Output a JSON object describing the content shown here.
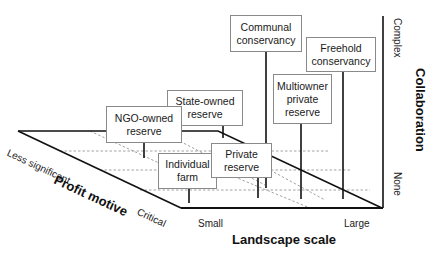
{
  "diagram": {
    "type": "3d-axis-diagram",
    "axes": {
      "x": {
        "title": "Landscape scale",
        "low": "Small",
        "high": "Large"
      },
      "y": {
        "title": "Profit motive",
        "low": "Less significant",
        "high": "Critical"
      },
      "z": {
        "title": "Collaboration",
        "low": "None",
        "high": "Complex"
      }
    },
    "items": [
      {
        "id": "communal",
        "label": "Communal\nconservancy"
      },
      {
        "id": "freehold",
        "label": "Freehold\nconservancy"
      },
      {
        "id": "multiowner",
        "label": "Multiowner\nprivate\nreserve"
      },
      {
        "id": "state",
        "label": "State-owned\nreserve"
      },
      {
        "id": "ngo",
        "label": "NGO-owned\nreserve"
      },
      {
        "id": "individual",
        "label": "Individual\nfarm"
      },
      {
        "id": "private",
        "label": "Private\nreserve"
      }
    ],
    "colors": {
      "line": "#111111",
      "dashed": "#888888",
      "box_border": "#8a8a8a"
    }
  }
}
